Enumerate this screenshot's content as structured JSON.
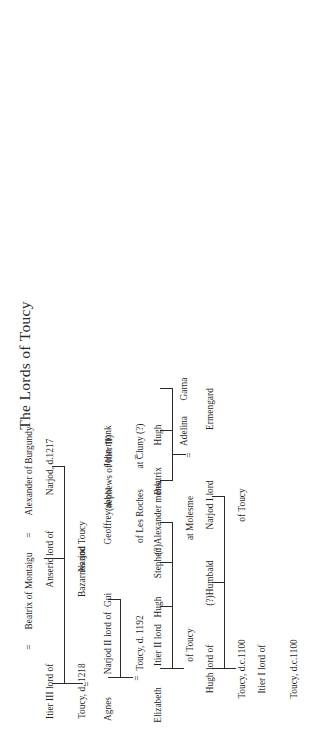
{
  "chart": {
    "title": "The Lords of Toucy",
    "type": "genealogical-family-tree",
    "orientation": "rotated-90-counterclockwise",
    "marriage_symbol": "=",
    "line_color": "#2a2a2a",
    "background_color": "#ffffff"
  },
  "generations": [
    {
      "index": 1,
      "people": [
        {
          "id": "itier1",
          "line1": "Itier I lord of",
          "line2": "Toucy, d.c.1100"
        }
      ]
    },
    {
      "index": 2,
      "people": [
        {
          "id": "hugh_lord",
          "line1": "Hugh lord of",
          "line2": "Toucy, d.c.1100"
        },
        {
          "id": "humbald",
          "line1": "(?)Humbald",
          "line2": ""
        },
        {
          "id": "narjod1",
          "line1": "Narjod I lord",
          "line2": "of Toucy"
        },
        {
          "id": "ermengard",
          "line1": "Ermengard",
          "line2": ""
        }
      ]
    },
    {
      "index": 3,
      "people": [
        {
          "id": "elizabeth",
          "line1": "Elizabeth",
          "line2": ""
        },
        {
          "id": "itier2",
          "line1": "Itier II lord",
          "line2": "of Toucy"
        },
        {
          "id": "hugh3",
          "line1": "Hugh",
          "line2": ""
        },
        {
          "id": "stephen",
          "line1": "Stephen",
          "line2": ""
        },
        {
          "id": "alexander_molesme",
          "line1": "(?)Alexander monk",
          "line2": "at Molesme"
        },
        {
          "id": "beatrix",
          "line1": "Beatrix",
          "line2": ""
        },
        {
          "id": "hugh_sp",
          "line1": "Hugh",
          "line2": ""
        },
        {
          "id": "adelina",
          "line1": "Adelina",
          "line2": ""
        },
        {
          "id": "garna",
          "line1": "Garna",
          "line2": ""
        }
      ]
    },
    {
      "index": 4,
      "people": [
        {
          "id": "agnes",
          "line1": "Agnes",
          "line2": ""
        },
        {
          "id": "narjod2",
          "line1": "Narjod II lord of",
          "line2": "Toucy, d. 1192"
        },
        {
          "id": "gui",
          "line1": "Gui",
          "line2": ""
        },
        {
          "id": "geoffrey",
          "line1": "Geoffrey abbot",
          "line2": "of Les Roches"
        },
        {
          "id": "john_cluny",
          "line1": "John monk",
          "line2": "at Cluny (?)"
        }
      ],
      "annotation": "(nephews of Itier II)"
    },
    {
      "index": 5,
      "people": [
        {
          "id": "itier3",
          "line1": "Itier III lord of",
          "line2": "Toucy, d. 1218"
        },
        {
          "id": "beatrix_montaigu",
          "line1": "Beatrix of Montaigu",
          "line2": ""
        },
        {
          "id": "alexander_burgundy",
          "line1": "Alexander of Burgundy",
          "line2": ""
        },
        {
          "id": "anseric",
          "line1": "Anseric lord of",
          "line2": "Bazarnes and Toucy"
        },
        {
          "id": "narjod_1217",
          "line1": "Narjod, d.1217",
          "line2": ""
        }
      ]
    },
    {
      "index": 6,
      "people": [
        {
          "id": "narjod_last",
          "line1": "Narjod",
          "line2": ""
        }
      ]
    }
  ],
  "labels": {
    "eq": "=",
    "itier1_l1": "Itier I lord of",
    "itier1_l2": "Toucy, d.c.1100",
    "hugh_lord_l1": "Hugh lord of",
    "hugh_lord_l2": "Toucy, d.c.1100",
    "humbald": "(?)Humbald",
    "narjod1_l1": "Narjod I lord",
    "narjod1_l2": "of Toucy",
    "ermengard": "Ermengard",
    "elizabeth": "Elizabeth",
    "itier2_l1": "Itier II lord",
    "itier2_l2": "of Toucy",
    "hugh3": "Hugh",
    "stephen": "Stephen",
    "alexander_molesme_l1": "(?)Alexander monk",
    "alexander_molesme_l2": "at Molesme",
    "beatrix": "Beatrix",
    "hugh_sp": "Hugh",
    "adelina": "Adelina",
    "garna": "Garna",
    "agnes": "Agnes",
    "narjod2_l1": "Narjod II lord of",
    "narjod2_l2": "Toucy, d. 1192",
    "gui": "Gui",
    "geoffrey_l1": "Geoffrey abbot",
    "geoffrey_l2": "of Les Roches",
    "john_cluny_l1": "John monk",
    "john_cluny_l2": "at Cluny (?)",
    "nephews_note": "(nephews of Itier II)",
    "itier3_l1": "Itier III lord of",
    "itier3_l2": "Toucy, d. 1218",
    "beatrix_montaigu": "Beatrix of Montaigu",
    "alexander_burgundy": "Alexander of Burgundy",
    "anseric_l1": "Anseric lord of",
    "anseric_l2": "Bazarnes and Toucy",
    "narjod_1217": "Narjod, d.1217",
    "narjod_last": "Narjod"
  }
}
